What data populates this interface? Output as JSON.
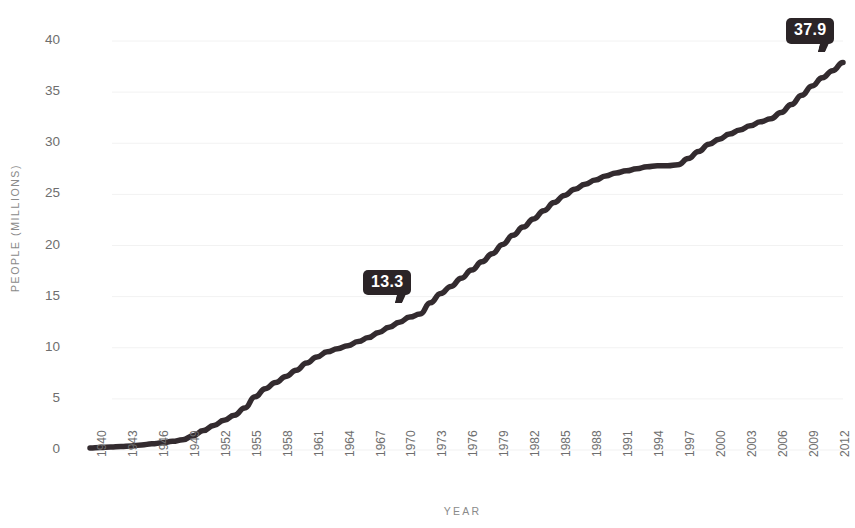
{
  "chart_data": {
    "type": "line",
    "title": "",
    "xlabel": "YEAR",
    "ylabel": "PEOPLE (MILLIONS)",
    "xlim": [
      1940,
      2013
    ],
    "ylim": [
      0,
      41.5
    ],
    "yticks": [
      0,
      5,
      10,
      15,
      20,
      25,
      30,
      35,
      40
    ],
    "ytick_labels": [
      "0",
      "5",
      "10",
      "15",
      "20",
      "25",
      "30",
      "35",
      "40"
    ],
    "xticks": [
      1940,
      1943,
      1946,
      1949,
      1952,
      1955,
      1958,
      1961,
      1964,
      1967,
      1970,
      1973,
      1976,
      1979,
      1982,
      1985,
      1988,
      1991,
      1994,
      1997,
      2000,
      2003,
      2006,
      2009,
      2012
    ],
    "xtick_labels": [
      "1940",
      "1943",
      "1946",
      "1949",
      "1952",
      "1955",
      "1958",
      "1961",
      "1964",
      "1967",
      "1970",
      "1973",
      "1976",
      "1979",
      "1982",
      "1985",
      "1988",
      "1991",
      "1994",
      "1997",
      "2000",
      "2003",
      "2006",
      "2009",
      "2012"
    ],
    "grid": true,
    "grid_axis": "y",
    "legend": false,
    "line_color": "#332b2f",
    "line_width": 5.5,
    "grid_color": "#f2f2f2",
    "series": [
      {
        "name": "People (millions)",
        "x": [
          1940,
          1941,
          1942,
          1943,
          1944,
          1945,
          1946,
          1947,
          1948,
          1949,
          1950,
          1951,
          1952,
          1953,
          1954,
          1955,
          1956,
          1957,
          1958,
          1959,
          1960,
          1961,
          1962,
          1963,
          1964,
          1965,
          1966,
          1967,
          1968,
          1969,
          1970,
          1971,
          1972,
          1973,
          1974,
          1975,
          1976,
          1977,
          1978,
          1979,
          1980,
          1981,
          1982,
          1983,
          1984,
          1985,
          1986,
          1987,
          1988,
          1989,
          1990,
          1991,
          1992,
          1993,
          1994,
          1995,
          1996,
          1997,
          1998,
          1999,
          2000,
          2001,
          2002,
          2003,
          2004,
          2005,
          2006,
          2007,
          2008,
          2009,
          2010,
          2011,
          2012,
          2013
        ],
        "values": [
          0.2,
          0.25,
          0.3,
          0.35,
          0.4,
          0.5,
          0.6,
          0.7,
          0.85,
          1.0,
          1.4,
          1.9,
          2.4,
          2.9,
          3.4,
          4.1,
          5.2,
          6.0,
          6.6,
          7.2,
          7.8,
          8.5,
          9.1,
          9.6,
          9.9,
          10.2,
          10.6,
          11.0,
          11.5,
          12.0,
          12.5,
          13.0,
          13.3,
          14.4,
          15.3,
          16.0,
          16.8,
          17.6,
          18.4,
          19.2,
          20.1,
          21.0,
          21.8,
          22.6,
          23.4,
          24.2,
          24.9,
          25.5,
          26.0,
          26.4,
          26.8,
          27.1,
          27.3,
          27.5,
          27.7,
          27.8,
          27.8,
          27.9,
          28.5,
          29.2,
          29.9,
          30.4,
          30.9,
          31.3,
          31.7,
          32.1,
          32.4,
          33.0,
          33.8,
          34.7,
          35.6,
          36.4,
          37.1,
          37.9
        ]
      }
    ],
    "annotations": [
      {
        "label": "13.3",
        "x": 1972,
        "y": 13.3,
        "name": "data-label-13-3"
      },
      {
        "label": "37.9",
        "x": 2013,
        "y": 37.9,
        "name": "data-label-37-9"
      }
    ]
  }
}
